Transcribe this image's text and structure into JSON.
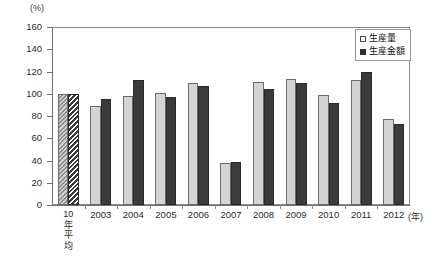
{
  "chart_data": {
    "type": "bar",
    "title": "",
    "xlabel": "年",
    "ylabel": "%",
    "y_unit_label": "(%)",
    "x_unit_label": "(年)",
    "ylim": [
      0,
      160
    ],
    "ytick_step": 20,
    "grid": false,
    "legend_position": "top-right",
    "categories": [
      "10年平均",
      "2003",
      "2004",
      "2005",
      "2006",
      "2007",
      "2008",
      "2009",
      "2010",
      "2011",
      "2012"
    ],
    "ytick_labels": [
      "0",
      "20",
      "40",
      "60",
      "80",
      "100",
      "120",
      "140",
      "160"
    ],
    "ytick_values": [
      0,
      20,
      40,
      60,
      80,
      100,
      120,
      140,
      160
    ],
    "series": [
      {
        "name": "生産量",
        "style": "light",
        "values": [
          100,
          89,
          98,
          101,
          110,
          38,
          111,
          113,
          99,
          112,
          77
        ]
      },
      {
        "name": "生産金額",
        "style": "dark",
        "values": [
          100,
          95,
          112,
          97,
          107,
          39,
          104,
          110,
          92,
          120,
          73
        ]
      }
    ],
    "baseline_category_index": 0,
    "baseline_hatched": true,
    "colors": {
      "light_bar": "#d4d4d4",
      "dark_bar": "#3b3b3b",
      "axis": "#6f6f6f",
      "frame": "#8c8c8c",
      "text": "#2b2b2b",
      "background": "#ffffff"
    }
  },
  "legend": {
    "items": [
      {
        "label": "生産量",
        "style": "light"
      },
      {
        "label": "生産金額",
        "style": "dark"
      }
    ]
  },
  "axis": {
    "first_category_lines": [
      "10",
      "年",
      "平",
      "均"
    ]
  }
}
